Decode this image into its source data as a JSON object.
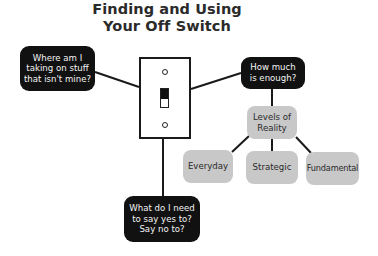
{
  "title": {
    "line1": "Finding and Using",
    "line2": "Your Off Switch"
  },
  "center": {
    "icon": "light-switch-icon",
    "label": "Off switch"
  },
  "nodes": {
    "where": {
      "line1": "Where am I",
      "line2": "taking on stuff",
      "line3": "that isn't mine?"
    },
    "enough": {
      "line1": "How much",
      "line2": "is enough?"
    },
    "say": {
      "line1": "What do I need",
      "line2": "to say yes to?",
      "line3": "Say no to?"
    },
    "levels": {
      "line1": "Levels of",
      "line2": "Reality"
    },
    "everyday": {
      "label": "Everyday"
    },
    "strategic": {
      "label": "Strategic"
    },
    "fundamental": {
      "label": "Fundamental"
    }
  },
  "edges": [
    [
      "switch",
      "where"
    ],
    [
      "switch",
      "enough"
    ],
    [
      "switch",
      "say"
    ],
    [
      "enough",
      "levels"
    ],
    [
      "levels",
      "everyday"
    ],
    [
      "levels",
      "strategic"
    ],
    [
      "levels",
      "fundamental"
    ]
  ],
  "colors": {
    "dark_node": "#111111",
    "light_node": "#c8c8c8",
    "line": "#1a1a1a",
    "background": "#ffffff"
  }
}
